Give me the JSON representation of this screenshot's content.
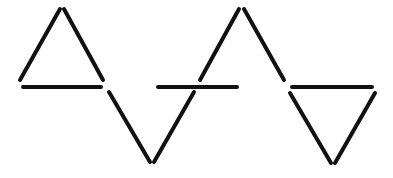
{
  "diagram": {
    "background": "#ffffff",
    "stick_color": "#111111",
    "sticks": [
      {
        "id": "t1-left",
        "x1": 20,
        "y1": 80,
        "x2": 60,
        "y2": 9
      },
      {
        "id": "t1-right",
        "x1": 64,
        "y1": 9,
        "x2": 103,
        "y2": 80
      },
      {
        "id": "t1-base",
        "x1": 23,
        "y1": 87,
        "x2": 101,
        "y2": 87
      },
      {
        "id": "v-left",
        "x1": 109,
        "y1": 92,
        "x2": 150,
        "y2": 162
      },
      {
        "id": "v-right",
        "x1": 154,
        "y1": 162,
        "x2": 194,
        "y2": 92
      },
      {
        "id": "mid-bar",
        "x1": 158,
        "y1": 87,
        "x2": 237,
        "y2": 87
      },
      {
        "id": "t2-left",
        "x1": 200,
        "y1": 80,
        "x2": 239,
        "y2": 9
      },
      {
        "id": "t2-right",
        "x1": 244,
        "y1": 9,
        "x2": 284,
        "y2": 80
      },
      {
        "id": "t3-top",
        "x1": 292,
        "y1": 87,
        "x2": 372,
        "y2": 87
      },
      {
        "id": "t3-left",
        "x1": 290,
        "y1": 93,
        "x2": 331,
        "y2": 163
      },
      {
        "id": "t3-right",
        "x1": 335,
        "y1": 163,
        "x2": 375,
        "y2": 93
      }
    ]
  }
}
